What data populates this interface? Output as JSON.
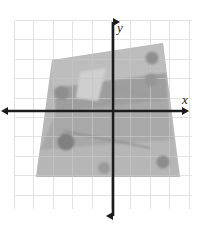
{
  "figure": {
    "type": "math-diagram",
    "background_color": "#ffffff",
    "width": 201,
    "height": 225
  },
  "grid": {
    "line_color": "#e2e2e2",
    "cell_size": 19.4,
    "origin_x": 113,
    "origin_y": 111,
    "left": 14.5,
    "top": 20.5,
    "right": 191.5,
    "bottom": 208.5,
    "columns": 9,
    "rows": 9,
    "visible": true
  },
  "axes": {
    "color": "#1c1c1c",
    "stroke_width": 2.6,
    "x_axis": {
      "label": "x",
      "label_x": 185,
      "label_y": 104,
      "y_position": 111,
      "start_x": 8,
      "end_x": 182,
      "arrows": "both"
    },
    "y_axis": {
      "label": "y",
      "label_x": 120,
      "label_y": 32,
      "x_position": 113,
      "start_y": 22,
      "end_y": 216,
      "arrows": "both"
    }
  },
  "shapes": {
    "quadrilateral": {
      "name": "shaded-quadrilateral",
      "fill": "#b2b2b2",
      "opacity": 0.92,
      "points": "52,60 163,43 180,177 36,177"
    },
    "band_upper": {
      "name": "inner-light-band",
      "fill": "#bdbdbd",
      "points": "52,60 163,43 166,73 54,88"
    },
    "band_middle": {
      "name": "inner-dark-band",
      "fill": "#9e9e9e",
      "points": "54,88 166,73 168,100 56,112"
    },
    "band_lower": {
      "name": "inner-lower-band",
      "fill": "#a8a8a8",
      "points": "56,112 168,100 172,140 40,150"
    },
    "band_bottom": {
      "name": "inner-bottom-band",
      "fill": "#b6b6b6",
      "points": "40,150 172,140 180,177 36,177"
    },
    "light_wedge": {
      "name": "light-triangular-wedge",
      "fill": "#cfcfcf",
      "points": "80,72 106,68 98,101 76,98"
    },
    "diagonal_streak": {
      "name": "diagonal-streak",
      "stroke": "#8a8a8a",
      "stroke_width": 1.6,
      "x1": 64,
      "y1": 131,
      "x2": 150,
      "y2": 148
    },
    "streak_secondary": {
      "name": "secondary-streak",
      "stroke": "#9a9a9a",
      "stroke_width": 1.2,
      "x1": 108,
      "y1": 86,
      "x2": 148,
      "y2": 96
    }
  },
  "spots": [
    {
      "name": "spot-upper-left",
      "cx": 62,
      "cy": 93,
      "r": 7.0,
      "fill": "#8e8e8e"
    },
    {
      "name": "spot-upper-right-top",
      "cx": 152,
      "cy": 58,
      "r": 6.5,
      "fill": "#909090"
    },
    {
      "name": "spot-upper-right-lower",
      "cx": 151,
      "cy": 80,
      "r": 6.5,
      "fill": "#969696"
    },
    {
      "name": "spot-lower-left",
      "cx": 66,
      "cy": 142,
      "r": 8.5,
      "fill": "#808080"
    },
    {
      "name": "spot-bottom-center",
      "cx": 104,
      "cy": 168,
      "r": 6.0,
      "fill": "#9a9a9a"
    },
    {
      "name": "spot-bottom-right",
      "cx": 163,
      "cy": 162,
      "r": 6.5,
      "fill": "#8c8c8c"
    }
  ],
  "colors": {
    "grid": "#e2e2e2",
    "axis": "#1c1c1c",
    "shape_fill": "#b2b2b2",
    "spot_fill": "#8e8e8e",
    "background": "#ffffff"
  }
}
